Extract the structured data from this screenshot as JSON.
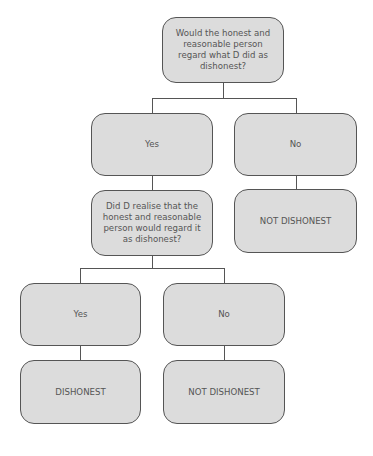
{
  "diagram": {
    "type": "decision-flowchart",
    "colors": {
      "box_fill": "#dcdcdc",
      "box_border": "#555555",
      "text": "#555555",
      "background": "#ffffff"
    },
    "nodes": {
      "q1": {
        "text": "Would the honest and reasonable person regard what D did as dishonest?"
      },
      "q1_yes": {
        "text": "Yes"
      },
      "q1_no": {
        "text": "No"
      },
      "q2": {
        "text": "Did D realise that the honest and reasonable person would regard it as dishonest?"
      },
      "q1_no_result": {
        "text": "NOT DISHONEST"
      },
      "q2_yes": {
        "text": "Yes"
      },
      "q2_no": {
        "text": "No"
      },
      "q2_yes_result": {
        "text": "DISHONEST"
      },
      "q2_no_result": {
        "text": "NOT DISHONEST"
      }
    },
    "edges": [
      {
        "from": "q1",
        "to": "q1_yes"
      },
      {
        "from": "q1",
        "to": "q1_no"
      },
      {
        "from": "q1_yes",
        "to": "q2"
      },
      {
        "from": "q1_no",
        "to": "q1_no_result"
      },
      {
        "from": "q2",
        "to": "q2_yes"
      },
      {
        "from": "q2",
        "to": "q2_no"
      },
      {
        "from": "q2_yes",
        "to": "q2_yes_result"
      },
      {
        "from": "q2_no",
        "to": "q2_no_result"
      }
    ]
  }
}
